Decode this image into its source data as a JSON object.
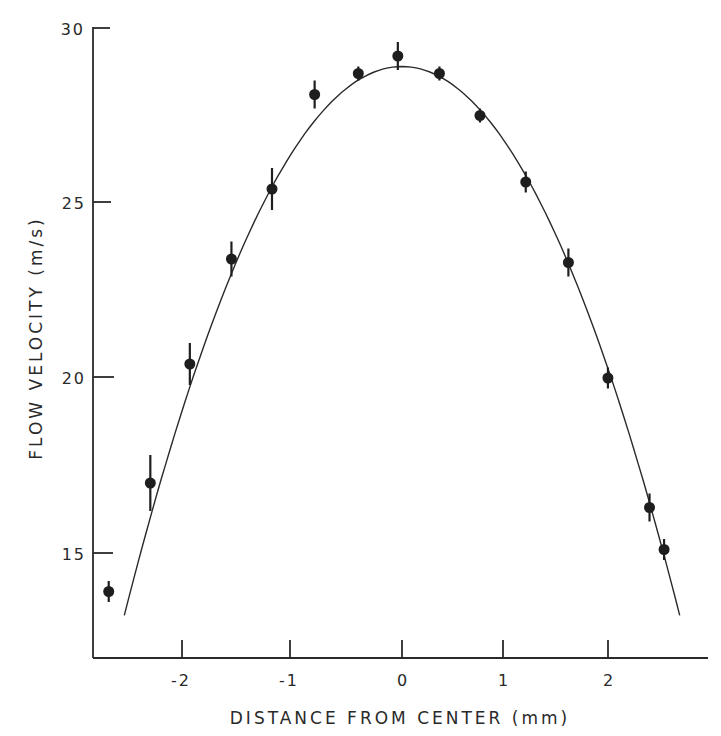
{
  "chart_data": {
    "type": "scatter",
    "title": "",
    "xlabel": "DISTANCE FROM CENTER (mm)",
    "ylabel": "FLOW VELOCITY (m/s)",
    "xlim": [
      -2.9,
      2.95
    ],
    "ylim": [
      12.5,
      30
    ],
    "x_ticks": [
      -2,
      -1,
      0,
      1,
      2
    ],
    "x_tick_labels": [
      "-2",
      "-1",
      "0",
      "1",
      "2"
    ],
    "y_ticks": [
      15,
      20,
      25,
      30
    ],
    "y_tick_labels": [
      "15",
      "20",
      "25",
      "30"
    ],
    "grid": false,
    "legend": null,
    "series": [
      {
        "name": "measured",
        "type": "scatter",
        "marker": "filled-circle-with-error-bars",
        "x": [
          -2.82,
          -2.42,
          -2.04,
          -1.64,
          -1.25,
          -0.84,
          -0.42,
          -0.04,
          0.36,
          0.75,
          1.19,
          1.6,
          1.98,
          2.38,
          2.52
        ],
        "y": [
          13.9,
          17.0,
          20.4,
          23.4,
          25.4,
          28.1,
          28.7,
          29.2,
          28.7,
          27.5,
          25.6,
          23.3,
          20.0,
          16.3,
          15.1
        ],
        "yerr": [
          0.3,
          0.8,
          0.6,
          0.5,
          0.6,
          0.4,
          0.2,
          0.4,
          0.2,
          0.2,
          0.3,
          0.4,
          0.3,
          0.4,
          0.3
        ]
      },
      {
        "name": "parabolic fit",
        "type": "line",
        "equation": "v = 28.9 - 2.2 x^2",
        "vertex": [
          0,
          28.9
        ],
        "x_range": [
          -2.67,
          2.67
        ]
      }
    ]
  },
  "axes": {
    "x_title": "DISTANCE FROM CENTER (mm)",
    "y_title": "FLOW VELOCITY (m/s)",
    "x_tick_labels": [
      "-2",
      "-1",
      "0",
      "1",
      "2"
    ],
    "y_tick_labels": [
      "30",
      "25",
      "20",
      "15"
    ]
  }
}
